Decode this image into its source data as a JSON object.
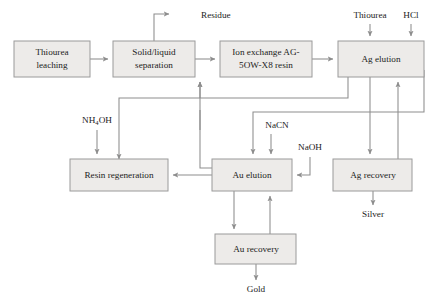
{
  "diagram": {
    "type": "process-flowchart",
    "colors": {
      "box_fill": "#edebe9",
      "box_stroke": "#9a9a9a",
      "arrow": "#8d8d8d",
      "text": "#1c1c1c",
      "background": "#ffffff"
    },
    "boxes": [
      {
        "id": "thiourea-leaching",
        "label": "Thiourea leaching",
        "lines": [
          "Thiourea",
          "leaching"
        ],
        "x": 14,
        "y": 41,
        "w": 76,
        "h": 36
      },
      {
        "id": "solid-liquid",
        "label": "Solid/liquid separation",
        "lines": [
          "Solid/liquid",
          "separation"
        ],
        "x": 113,
        "y": 41,
        "w": 82,
        "h": 36
      },
      {
        "id": "ion-exchange",
        "label": "Ion exchange AG-5OW-X8 resin",
        "lines": [
          "Ion exchange AG-",
          "5OW-X8 resin"
        ],
        "x": 220,
        "y": 41,
        "w": 92,
        "h": 36
      },
      {
        "id": "ag-elution",
        "label": "Ag elution",
        "lines": [
          "Ag elution"
        ],
        "x": 338,
        "y": 41,
        "w": 86,
        "h": 36
      },
      {
        "id": "resin-regeneration",
        "label": "Resin regeneration",
        "lines": [
          "Resin regeneration"
        ],
        "x": 70,
        "y": 159,
        "w": 98,
        "h": 32
      },
      {
        "id": "au-elution",
        "label": "Au elution",
        "lines": [
          "Au elution"
        ],
        "x": 212,
        "y": 159,
        "w": 80,
        "h": 32
      },
      {
        "id": "ag-recovery",
        "label": "Ag recovery",
        "lines": [
          "Ag recovery"
        ],
        "x": 333,
        "y": 159,
        "w": 79,
        "h": 32
      },
      {
        "id": "au-recovery",
        "label": "Au recovery",
        "lines": [
          "Au recovery"
        ],
        "x": 215,
        "y": 234,
        "w": 81,
        "h": 30
      }
    ],
    "stream_labels": [
      {
        "id": "residue",
        "text": "Residue",
        "x": 201,
        "y": 18
      },
      {
        "id": "thiourea-feed",
        "text": "Thiourea",
        "x": 370,
        "y": 18
      },
      {
        "id": "hcl-feed",
        "text": "HCl",
        "x": 411,
        "y": 18
      },
      {
        "id": "nh4oh-feed",
        "pre": "NH",
        "sub": "4",
        "post": "OH",
        "text": "NH4OH",
        "x": 97,
        "y": 123
      },
      {
        "id": "nacn-feed",
        "text": "NaCN",
        "x": 277,
        "y": 128
      },
      {
        "id": "naoh-feed",
        "text": "NaOH",
        "x": 310,
        "y": 150
      },
      {
        "id": "silver-product",
        "text": "Silver",
        "x": 373,
        "y": 215
      },
      {
        "id": "gold-product",
        "text": "Gold",
        "x": 256,
        "y": 291
      }
    ],
    "connections": [
      {
        "id": "leach-to-separation",
        "from": "thiourea-leaching",
        "to": "solid-liquid"
      },
      {
        "id": "separation-to-residue",
        "from": "solid-liquid",
        "to": "residue"
      },
      {
        "id": "separation-to-ion-exchange",
        "from": "solid-liquid",
        "to": "ion-exchange"
      },
      {
        "id": "ion-exchange-to-ag-elution",
        "from": "ion-exchange",
        "to": "ag-elution"
      },
      {
        "id": "thiourea-to-ag-elution",
        "from": "thiourea-feed",
        "to": "ag-elution"
      },
      {
        "id": "hcl-to-ag-elution",
        "from": "hcl-feed",
        "to": "ag-elution"
      },
      {
        "id": "ag-elution-to-ag-recovery",
        "from": "ag-elution",
        "to": "ag-recovery"
      },
      {
        "id": "ag-recovery-to-ag-elution",
        "from": "ag-recovery",
        "to": "ag-elution"
      },
      {
        "id": "ag-recovery-to-silver",
        "from": "ag-recovery",
        "to": "silver-product"
      },
      {
        "id": "ag-elution-to-resin-regeneration",
        "from": "ag-elution",
        "to": "resin-regeneration"
      },
      {
        "id": "nh4oh-to-resin-regeneration",
        "from": "nh4oh-feed",
        "to": "resin-regeneration"
      },
      {
        "id": "au-elution-to-resin-regeneration",
        "from": "au-elution",
        "to": "resin-regeneration"
      },
      {
        "id": "au-elution-to-ion-exchange",
        "from": "au-elution",
        "to": "ion-exchange"
      },
      {
        "id": "nacn-to-au-elution",
        "from": "nacn-feed",
        "to": "au-elution"
      },
      {
        "id": "ag-elution-to-au-elution",
        "from": "ag-elution",
        "to": "au-elution"
      },
      {
        "id": "naoh-to-au-elution",
        "from": "naoh-feed",
        "to": "au-elution"
      },
      {
        "id": "au-elution-to-au-recovery",
        "from": "au-elution",
        "to": "au-recovery"
      },
      {
        "id": "au-recovery-to-au-elution",
        "from": "au-recovery",
        "to": "au-elution"
      },
      {
        "id": "au-recovery-to-gold",
        "from": "au-recovery",
        "to": "gold-product"
      }
    ]
  }
}
